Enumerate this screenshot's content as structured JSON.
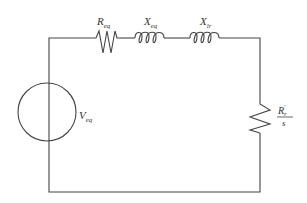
{
  "diagram": {
    "type": "equivalent-circuit",
    "components": [
      {
        "id": "source",
        "kind": "voltage-source",
        "label": "V",
        "subscript": "eq"
      },
      {
        "id": "r_eq",
        "kind": "resistor",
        "label": "R",
        "subscript": "eq"
      },
      {
        "id": "x_eq",
        "kind": "inductor",
        "label": "X",
        "subscript": "eq"
      },
      {
        "id": "x_lr",
        "kind": "inductor",
        "label": "X",
        "subscript": "lr"
      },
      {
        "id": "r_load",
        "kind": "resistor",
        "label_numerator": "R",
        "numerator_subscript": "r",
        "numerator_prime": "′",
        "label_denominator": "s"
      }
    ]
  },
  "colors": {
    "wire": "#444444",
    "text": "#333333",
    "background": "#ffffff"
  }
}
